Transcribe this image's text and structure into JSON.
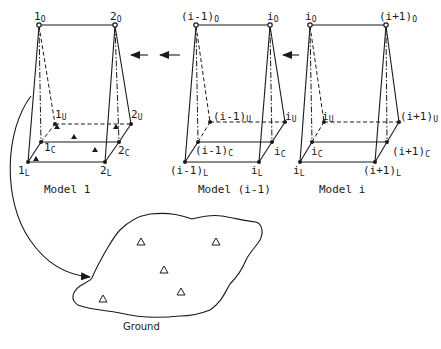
{
  "diagram": {
    "type": "photogrammetric strip triangulation schematic",
    "models": [
      {
        "caption": "Model 1",
        "projection_centers": [
          {
            "base": "1",
            "sub": "O"
          },
          {
            "base": "2",
            "sub": "O"
          }
        ],
        "upper_points": [
          {
            "base": "1",
            "sub": "U"
          },
          {
            "base": "2",
            "sub": "U"
          }
        ],
        "center_points": [
          {
            "base": "1",
            "sub": "C"
          },
          {
            "base": "2",
            "sub": "C"
          }
        ],
        "lower_points": [
          {
            "base": "1",
            "sub": "L"
          },
          {
            "base": "2",
            "sub": "L"
          }
        ],
        "control_points": 5
      },
      {
        "caption": "Model (i-1)",
        "projection_centers": [
          {
            "base": "(i-1)",
            "sub": "O"
          },
          {
            "base": "i",
            "sub": "O"
          }
        ],
        "upper_points": [
          {
            "base": "(i-1)",
            "sub": "U"
          },
          {
            "base": "i",
            "sub": "U"
          }
        ],
        "center_points": [
          {
            "base": "(i-1)",
            "sub": "C"
          },
          {
            "base": "i",
            "sub": "C"
          }
        ],
        "lower_points": [
          {
            "base": "(i-1)",
            "sub": "L"
          },
          {
            "base": "i",
            "sub": "L"
          }
        ]
      },
      {
        "caption": "Model i",
        "projection_centers": [
          {
            "base": "i",
            "sub": "O"
          },
          {
            "base": "(i+1)",
            "sub": "O"
          }
        ],
        "upper_points": [
          {
            "base": "i",
            "sub": "U"
          },
          {
            "base": "(i+1)",
            "sub": "U"
          }
        ],
        "center_points": [
          {
            "base": "i",
            "sub": "C"
          },
          {
            "base": "(i+1)",
            "sub": "C"
          }
        ],
        "lower_points": [
          {
            "base": "i",
            "sub": "L"
          },
          {
            "base": "(i+1)",
            "sub": "L"
          }
        ]
      }
    ],
    "arrows": [
      "Model (i-1) → Model 1",
      "Model i → Model (i-1)",
      "Model 1 → Ground"
    ],
    "ground": {
      "label": "Ground",
      "control_points": 5
    }
  }
}
